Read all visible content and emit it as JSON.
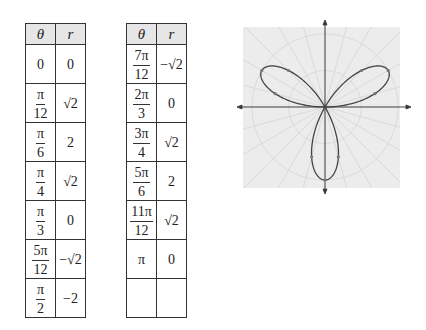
{
  "tables": [
    {
      "headers": {
        "theta": "θ",
        "r": "r"
      },
      "rows": [
        {
          "theta_num": "0",
          "theta_den": "",
          "r": "0"
        },
        {
          "theta_num": "π",
          "theta_den": "12",
          "r": "√2"
        },
        {
          "theta_num": "π",
          "theta_den": "6",
          "r": "2"
        },
        {
          "theta_num": "π",
          "theta_den": "4",
          "r": "√2"
        },
        {
          "theta_num": "π",
          "theta_den": "3",
          "r": "0"
        },
        {
          "theta_num": "5π",
          "theta_den": "12",
          "r": "−√2"
        },
        {
          "theta_num": "π",
          "theta_den": "2",
          "r": "−2"
        }
      ]
    },
    {
      "headers": {
        "theta": "θ",
        "r": "r"
      },
      "rows": [
        {
          "theta_num": "7π",
          "theta_den": "12",
          "r": "−√2"
        },
        {
          "theta_num": "2π",
          "theta_den": "3",
          "r": "0"
        },
        {
          "theta_num": "3π",
          "theta_den": "4",
          "r": "√2"
        },
        {
          "theta_num": "5π",
          "theta_den": "6",
          "r": "2"
        },
        {
          "theta_num": "11π",
          "theta_den": "12",
          "r": "√2"
        },
        {
          "theta_num": "π",
          "theta_den": "",
          "r": "0"
        },
        {
          "theta_num": "",
          "theta_den": "",
          "r": ""
        }
      ]
    }
  ],
  "chart_data": {
    "type": "polar",
    "equation": "r = 2 sin(3θ)",
    "title": "",
    "theta_values": [
      "0",
      "π/12",
      "π/6",
      "π/4",
      "π/3",
      "5π/12",
      "π/2",
      "7π/12",
      "2π/3",
      "3π/4",
      "5π/6",
      "11π/12",
      "π"
    ],
    "r_values": [
      0,
      1.414,
      2,
      1.414,
      0,
      -1.414,
      -2,
      -1.414,
      0,
      1.414,
      2,
      1.414,
      0
    ],
    "petals": 3,
    "max_r": 2,
    "grid": "polar, light gray background",
    "axes": "x and y axes with arrowheads"
  },
  "colors": {
    "curve": "#444444",
    "grid": "#c8c8c8",
    "background": "#ececec",
    "header": "#e6e6e6"
  }
}
